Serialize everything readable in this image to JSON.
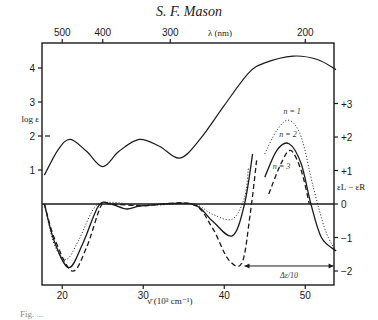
{
  "header": {
    "running_head": "S. F. Mason"
  },
  "caption": {
    "partial_text": "Fig. ..."
  },
  "chart_data": [
    {
      "type": "line",
      "title": "Absorption spectrum",
      "xlabel": "ν̄ (10³ cm⁻¹)",
      "ylabel": "log ε",
      "xlim": [
        17.8,
        53.8
      ],
      "ylim": [
        -3.9,
        4.5
      ],
      "x_ticks": [
        20,
        30,
        40,
        50
      ],
      "y_ticks": [
        1,
        2,
        3,
        4
      ],
      "top_axis": {
        "label": "λ (nm)",
        "ticks": [
          500,
          400,
          300,
          200
        ]
      },
      "series": [
        {
          "name": "log ε",
          "style": "solid",
          "x": [
            17.8,
            19.5,
            21.0,
            23.0,
            25.0,
            27.0,
            29.5,
            32.0,
            34.5,
            37.0,
            40.0,
            43.0,
            45.0,
            48.5,
            51.5,
            53.8
          ],
          "y": [
            0.85,
            1.6,
            1.9,
            1.55,
            1.1,
            1.55,
            1.9,
            1.7,
            1.35,
            1.9,
            2.9,
            3.85,
            4.15,
            4.35,
            4.25,
            3.95
          ]
        }
      ],
      "grid": false
    },
    {
      "type": "line",
      "title": "Circular dichroism",
      "xlabel": "ν̄ (10³ cm⁻¹)",
      "ylabel": "εL − εR",
      "y_ticks": [
        "+3",
        "+2",
        "+1",
        "0",
        "−1",
        "−2"
      ],
      "annotation": "Δε/10",
      "annotation_range_x": [
        42.5,
        53.5
      ],
      "series": [
        {
          "name": "n = 1",
          "style": "dotted",
          "x": [
            17.8,
            19.0,
            20.5,
            22.0,
            24.0,
            26.0,
            30.0,
            36.0,
            38.5,
            41.0,
            42.5,
            43.0
          ],
          "y": [
            0,
            -1.2,
            -1.65,
            -1.1,
            -0.1,
            0.05,
            -0.05,
            0,
            -0.3,
            -0.45,
            0.2,
            1.1
          ],
          "x_band2": [
            45.0,
            46.5,
            48.0,
            49.5,
            51.0,
            52.5,
            53.8
          ],
          "y_band2": [
            1.5,
            2.2,
            2.5,
            2.0,
            0.5,
            -0.8,
            -1.4
          ]
        },
        {
          "name": "n = 2",
          "style": "solid",
          "x": [
            17.8,
            19.0,
            20.8,
            22.5,
            24.5,
            26.0,
            28.0,
            30.0,
            36.0,
            38.5,
            41.0,
            42.5,
            43.5
          ],
          "y": [
            0,
            -1.1,
            -1.9,
            -1.2,
            -0.05,
            0,
            -0.15,
            -0.05,
            0,
            -0.5,
            -0.95,
            0,
            1.5
          ],
          "x_band2": [
            45.0,
            46.5,
            48.0,
            49.5,
            50.7,
            52.0,
            53.8
          ],
          "y_band2": [
            0.8,
            1.6,
            1.8,
            1.2,
            0,
            -1.0,
            -1.4
          ]
        },
        {
          "name": "n = 3",
          "style": "dashed",
          "x": [
            17.8,
            19.0,
            21.2,
            23.0,
            24.8,
            26.0,
            30.0,
            36.0,
            38.5,
            40.5,
            42.2,
            43.2,
            44.0
          ],
          "y": [
            0,
            -1.0,
            -2.0,
            -1.3,
            -0.05,
            0,
            -0.05,
            0,
            -0.7,
            -1.65,
            -1.75,
            -0.3,
            1.3
          ],
          "x_band2": [
            45.5,
            47.0,
            48.2,
            49.5,
            50.5
          ],
          "y_band2": [
            0.3,
            1.2,
            1.6,
            1.0,
            0
          ]
        }
      ]
    }
  ]
}
